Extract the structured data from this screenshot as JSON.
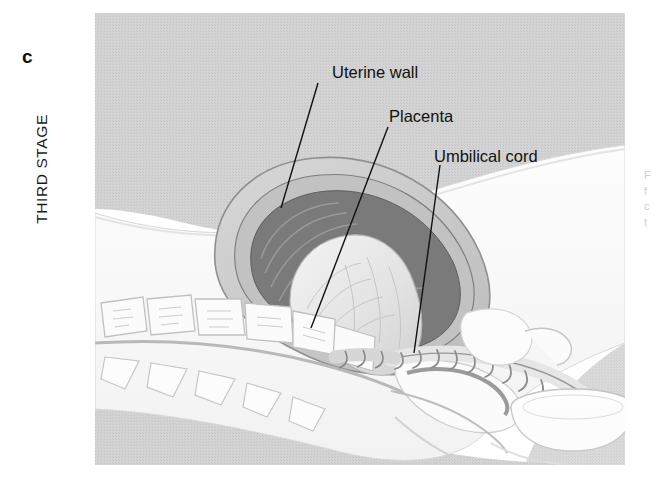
{
  "figure": {
    "panel_letter": "c",
    "stage_label": "THIRD STAGE",
    "callouts": [
      {
        "id": "uterine-wall",
        "label": "Uterine wall",
        "leader_from": [
          238,
          70
        ],
        "leader_to": [
          186,
          195
        ]
      },
      {
        "id": "placenta",
        "label": "Placenta",
        "leader_from": [
          293,
          114
        ],
        "leader_to": [
          216,
          315
        ]
      },
      {
        "id": "umbilical-cord",
        "label": "Umbilical cord",
        "leader_from": [
          345,
          152
        ],
        "leader_to": [
          319,
          340
        ]
      }
    ],
    "side_caption_lines": [
      "F",
      "f",
      "c",
      "t"
    ],
    "colors": {
      "background_tint": "#d2d2d2",
      "uterus_outer": "#c9c9c9",
      "uterus_wall": "#9a9a9a",
      "uterus_cavity_dark": "#6f6f6f",
      "placenta_fill": "#e8e8e8",
      "skin_white": "#fdfdfd",
      "bone_outline": "#bcbcbc",
      "cord_shade": "#8d8d8d",
      "ink": "#111111"
    }
  }
}
